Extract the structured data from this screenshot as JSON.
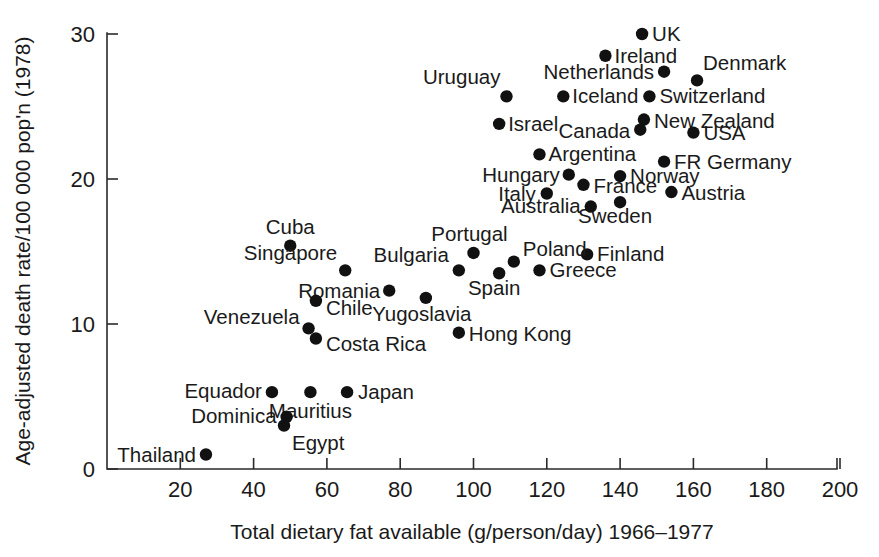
{
  "chart_data": {
    "type": "scatter",
    "title": "",
    "xlabel": "Total dietary fat available (g/person/day) 1966–1977",
    "ylabel": "Age-adjusted death rate/100 000 pop'n (1978)",
    "xlim": [
      5,
      200
    ],
    "ylim": [
      0,
      30.6
    ],
    "xticks": [
      20,
      40,
      60,
      80,
      100,
      120,
      140,
      160,
      180,
      200
    ],
    "xticklabels": [
      "20",
      "40",
      "60",
      "80",
      "100",
      "120",
      "140",
      "160",
      "180",
      "200"
    ],
    "yticks": [
      0,
      10,
      20,
      30
    ],
    "yticklabels": [
      "0",
      "10",
      "20",
      "30"
    ],
    "grid": false,
    "legend": "none",
    "marker_color": "#111111",
    "axis_color": "#2a2a2a",
    "points": [
      {
        "label": "UK",
        "x": 146.0,
        "y": 30.0,
        "lx": 10,
        "ly": 7,
        "anchor": "start"
      },
      {
        "label": "Ireland",
        "x": 136.0,
        "y": 28.5,
        "lx": 9,
        "ly": 7,
        "anchor": "start"
      },
      {
        "label": "Netherlands",
        "x": 152.0,
        "y": 27.4,
        "lx": -10,
        "ly": 7,
        "anchor": "end"
      },
      {
        "label": "Denmark",
        "x": 161.0,
        "y": 26.8,
        "lx": 6,
        "ly": -10,
        "anchor": "start"
      },
      {
        "label": "Uruguay",
        "x": 109.0,
        "y": 25.7,
        "lx": -6,
        "ly": -12,
        "anchor": "end"
      },
      {
        "label": "Iceland",
        "x": 124.5,
        "y": 25.7,
        "lx": 9,
        "ly": 7,
        "anchor": "start"
      },
      {
        "label": "Switzerland",
        "x": 148.0,
        "y": 25.7,
        "lx": 10,
        "ly": 7,
        "anchor": "start"
      },
      {
        "label": "Israel",
        "x": 107.0,
        "y": 23.8,
        "lx": 9,
        "ly": 7,
        "anchor": "start"
      },
      {
        "label": "Canada",
        "x": 145.5,
        "y": 23.4,
        "lx": -10,
        "ly": 8,
        "anchor": "end"
      },
      {
        "label": "New Zealand",
        "x": 146.5,
        "y": 24.1,
        "lx": 10,
        "ly": 8,
        "anchor": "start"
      },
      {
        "label": "USA",
        "x": 160.0,
        "y": 23.2,
        "lx": 10,
        "ly": 7,
        "anchor": "start"
      },
      {
        "label": "Argentina",
        "x": 118.0,
        "y": 21.7,
        "lx": 9,
        "ly": 7,
        "anchor": "start"
      },
      {
        "label": "FR Germany",
        "x": 152.0,
        "y": 21.2,
        "lx": 10,
        "ly": 7,
        "anchor": "start"
      },
      {
        "label": "Hungary",
        "x": 126.0,
        "y": 20.3,
        "lx": -9,
        "ly": 7,
        "anchor": "end"
      },
      {
        "label": "Norway",
        "x": 140.0,
        "y": 20.2,
        "lx": 10,
        "ly": 7,
        "anchor": "start"
      },
      {
        "label": "France",
        "x": 130.0,
        "y": 19.6,
        "lx": 10,
        "ly": 8,
        "anchor": "start"
      },
      {
        "label": "Italy",
        "x": 120.0,
        "y": 19.0,
        "lx": -11,
        "ly": 7,
        "anchor": "end"
      },
      {
        "label": "Austria",
        "x": 154.0,
        "y": 19.1,
        "lx": 10,
        "ly": 8,
        "anchor": "start"
      },
      {
        "label": "Sweden",
        "x": 140.0,
        "y": 18.4,
        "lx": -5,
        "ly": 21,
        "anchor": "middle"
      },
      {
        "label": "Australia",
        "x": 132.0,
        "y": 18.1,
        "lx": -10,
        "ly": 6,
        "anchor": "end"
      },
      {
        "label": "Cuba",
        "x": 50.0,
        "y": 15.4,
        "lx": 0,
        "ly": -12,
        "anchor": "middle"
      },
      {
        "label": "Portugal",
        "x": 100.0,
        "y": 14.9,
        "lx": -4,
        "ly": -12,
        "anchor": "middle"
      },
      {
        "label": "Finland",
        "x": 131.0,
        "y": 14.8,
        "lx": 10,
        "ly": 7,
        "anchor": "start"
      },
      {
        "label": "Poland",
        "x": 111.0,
        "y": 14.3,
        "lx": 9,
        "ly": -6,
        "anchor": "start"
      },
      {
        "label": "Singapore",
        "x": 65.0,
        "y": 13.7,
        "lx": -8,
        "ly": -10,
        "anchor": "end"
      },
      {
        "label": "Bulgaria",
        "x": 96.0,
        "y": 13.7,
        "lx": -10,
        "ly": -8,
        "anchor": "end"
      },
      {
        "label": "Greece",
        "x": 118.0,
        "y": 13.7,
        "lx": 10,
        "ly": 7,
        "anchor": "start"
      },
      {
        "label": "Spain",
        "x": 107.0,
        "y": 13.5,
        "lx": -5,
        "ly": 22,
        "anchor": "middle"
      },
      {
        "label": "Romania",
        "x": 77.0,
        "y": 12.3,
        "lx": -9,
        "ly": 7,
        "anchor": "end"
      },
      {
        "label": "Yugoslavia",
        "x": 87.0,
        "y": 11.8,
        "lx": -4,
        "ly": 23,
        "anchor": "middle"
      },
      {
        "label": "Chile",
        "x": 57.0,
        "y": 11.6,
        "lx": 10,
        "ly": 14,
        "anchor": "start"
      },
      {
        "label": "Venezuela",
        "x": 55.0,
        "y": 9.7,
        "lx": -9,
        "ly": -4,
        "anchor": "end"
      },
      {
        "label": "Hong Kong",
        "x": 96.0,
        "y": 9.4,
        "lx": 10,
        "ly": 8,
        "anchor": "start"
      },
      {
        "label": "Costa Rica",
        "x": 57.0,
        "y": 9.0,
        "lx": 10,
        "ly": 12,
        "anchor": "start"
      },
      {
        "label": "Equador",
        "x": 45.0,
        "y": 5.3,
        "lx": -10,
        "ly": 6,
        "anchor": "end"
      },
      {
        "label": "Mauritius",
        "x": 55.5,
        "y": 5.3,
        "lx": 0,
        "ly": 26,
        "anchor": "middle"
      },
      {
        "label": "Japan",
        "x": 65.5,
        "y": 5.3,
        "lx": 11,
        "ly": 7,
        "anchor": "start"
      },
      {
        "label": "Dominica",
        "x": 49.0,
        "y": 3.6,
        "lx": -10,
        "ly": 6,
        "anchor": "end"
      },
      {
        "label": "Egypt",
        "x": 48.3,
        "y": 3.0,
        "lx": 8,
        "ly": 24,
        "anchor": "start"
      },
      {
        "label": "Thailand",
        "x": 27.0,
        "y": 1.0,
        "lx": -10,
        "ly": 7,
        "anchor": "end"
      }
    ]
  }
}
